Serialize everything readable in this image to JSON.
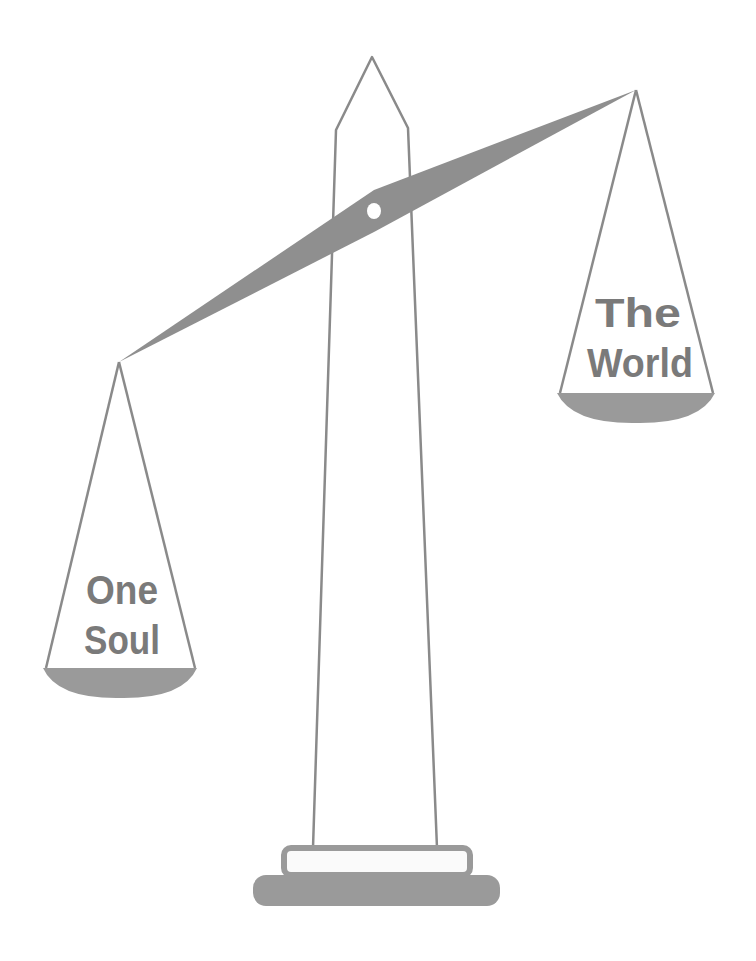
{
  "illustration": {
    "subject": "balance scale with obelisk",
    "left_pan": {
      "lines": [
        "One",
        "Soul"
      ]
    },
    "right_pan": {
      "lines": [
        "The",
        "World"
      ]
    }
  },
  "colors": {
    "background": "#ffffff",
    "outline": "#8a8a8a",
    "fill": "#9a9a9a",
    "text": "#7a7a7a",
    "beam": "#8f8f8f"
  }
}
